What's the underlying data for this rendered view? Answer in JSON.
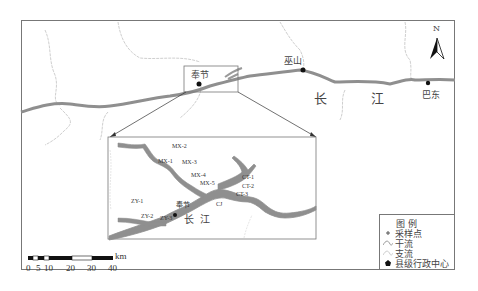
{
  "map": {
    "north_arrow": {
      "label": "N"
    },
    "cities": [
      {
        "name": "奉节",
        "type": "county-center"
      },
      {
        "name": "巫山",
        "type": "county-center"
      },
      {
        "name": "巴东",
        "type": "county-center"
      }
    ],
    "main_river_label": [
      "长",
      "江"
    ],
    "inset": {
      "river_label": [
        "长",
        "江"
      ],
      "city": "奉节",
      "sample_points": [
        "MX-1",
        "MX-2",
        "MX-3",
        "MX-4",
        "MX-5",
        "CT-1",
        "CT-2",
        "CT-3",
        "ZY-1",
        "ZY-2",
        "ZY-3",
        "CJ"
      ]
    }
  },
  "legend": {
    "title": "图 例",
    "items": [
      {
        "symbol": "sample-point",
        "label": "采样点"
      },
      {
        "symbol": "main-stream",
        "label": "干流"
      },
      {
        "symbol": "tributary",
        "label": "支流"
      },
      {
        "symbol": "county-center",
        "label": "县级行政中心"
      }
    ]
  },
  "scale_bar": {
    "unit": "km",
    "ticks": [
      "0",
      "5",
      "10",
      "20",
      "30",
      "40"
    ]
  },
  "colors": {
    "river": "#8f8f8f",
    "tributary": "#c8c8c8",
    "border": "#777777",
    "point": "#111111"
  }
}
